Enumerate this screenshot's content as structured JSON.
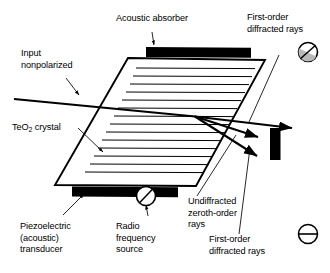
{
  "figure": {
    "type": "technical-diagram",
    "background_color": "#ffffff",
    "ink_color": "#000000"
  },
  "labels": {
    "acoustic_absorber": "Acoustic absorber",
    "input_nonpolarized": "Input\nnonpolarized",
    "teo2_crystal_pre": "TeO",
    "teo2_crystal_sub": "2",
    "teo2_crystal_post": " crystal",
    "piezoelectric_transducer": "Piezoelectric\n(acoustic)\ntransducer",
    "radio_frequency_source": "Radio\nfrequency\nsource",
    "undiffracted_zeroth_order": "Undiffracted\nzeroth-order\nrays",
    "first_order_top": "First-order\ndiffracted rays",
    "first_order_bottom": "First-order\ndiffracted rays"
  },
  "components": {
    "acoustic_absorber_bar": {
      "fill": "#000000",
      "name": "acoustic-absorber-bar"
    },
    "piezoelectric_transducer_bar": {
      "fill": "#000000",
      "name": "piezoelectric-transducer-bar"
    },
    "crystal_body": {
      "fill": "#ffffff",
      "stroke": "#000000",
      "name": "teo2-crystal-parallelogram"
    },
    "beam_stop_block": {
      "fill": "#000000",
      "name": "beam-stop-block"
    },
    "acoustic_wave_lines": {
      "count": 14,
      "stroke": "#000000",
      "name": "acoustic-wavefront-lines"
    }
  },
  "symbols": {
    "rf_source": {
      "glyph": "circle-with-diagonal-slash",
      "name": "rf-source-symbol"
    },
    "polarization_top": {
      "glyph": "circle-with-diagonal-slash-shaded",
      "name": "polarization-state-symbol-top"
    },
    "polarization_bottom": {
      "glyph": "circle-with-horizontal-bar",
      "name": "polarization-state-symbol-bottom"
    }
  },
  "rays": {
    "input_beam": "incoming nonpolarized beam entering crystal from upper left",
    "zeroth_order": "undiffracted zeroth-order ray continuing straight through",
    "first_order_upper": "first-order diffracted ray deflected upward toward detector",
    "first_order_lower": "first-order diffracted ray deflected downward toward beam stop"
  }
}
